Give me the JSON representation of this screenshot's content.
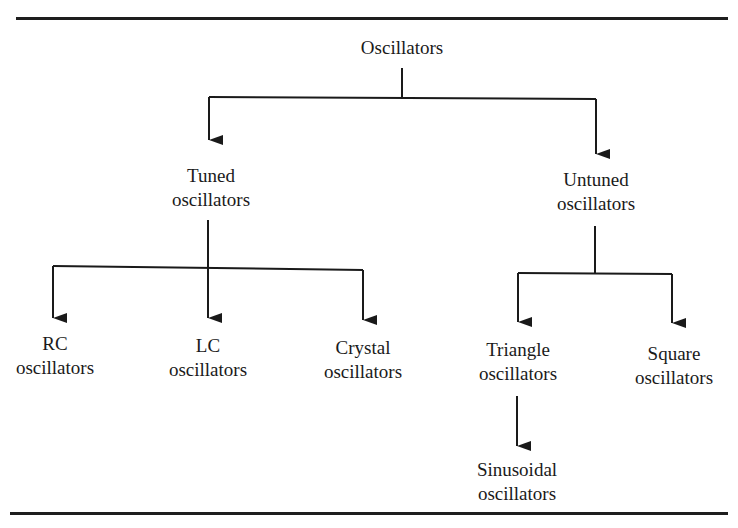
{
  "diagram": {
    "root": {
      "line1": "Oscillators",
      "line2": ""
    },
    "tuned": {
      "line1": "Tuned",
      "line2": "oscillators"
    },
    "untuned": {
      "line1": "Untuned",
      "line2": "oscillators"
    },
    "rc": {
      "line1": "RC",
      "line2": "oscillators"
    },
    "lc": {
      "line1": "LC",
      "line2": "oscillators"
    },
    "crystal": {
      "line1": "Crystal",
      "line2": "oscillators"
    },
    "triangle": {
      "line1": "Triangle",
      "line2": "oscillators"
    },
    "square": {
      "line1": "Square",
      "line2": "oscillators"
    },
    "sinusoidal": {
      "line1": "Sinusoidal",
      "line2": "oscillators"
    }
  },
  "edges": [
    [
      "Oscillators",
      "Tuned oscillators"
    ],
    [
      "Oscillators",
      "Untuned oscillators"
    ],
    [
      "Tuned oscillators",
      "RC oscillators"
    ],
    [
      "Tuned oscillators",
      "LC oscillators"
    ],
    [
      "Tuned oscillators",
      "Crystal oscillators"
    ],
    [
      "Untuned oscillators",
      "Triangle oscillators"
    ],
    [
      "Untuned oscillators",
      "Square oscillators"
    ],
    [
      "Triangle oscillators",
      "Sinusoidal oscillators"
    ]
  ]
}
